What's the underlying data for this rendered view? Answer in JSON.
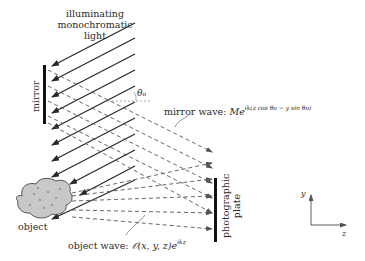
{
  "labels": {
    "light_line1": "illuminating",
    "light_line2": "monochromatic",
    "light_line3": "light",
    "mirror": "mirror",
    "theta": "θ",
    "theta_sub": "o",
    "mirror_wave_prefix": "mirror wave: ",
    "mirror_wave_M": "Me",
    "mirror_wave_exp": "ik(z cos θo − y sin θo)",
    "plate_line1": "photographic",
    "plate_line2": "plate",
    "object": "object",
    "object_wave_prefix": "object wave: ",
    "object_wave_func": "𝒪(x, y, z)e",
    "object_wave_exp": "ikz",
    "axis_y": "y",
    "axis_z": "z"
  },
  "colors": {
    "ink": "#2a2a2a",
    "dashed": "#555555",
    "object_fill": "#c8c8c8"
  }
}
